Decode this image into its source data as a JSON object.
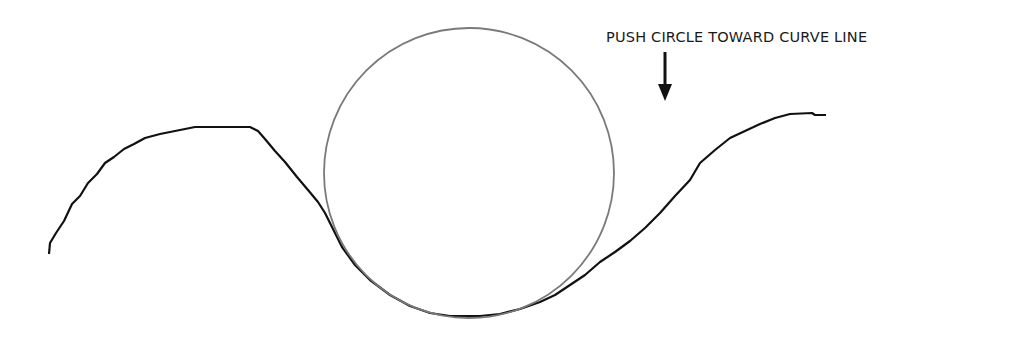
{
  "annotation": {
    "text": "PUSH CIRCLE TOWARD CURVE LINE",
    "arrow_direction": "down"
  },
  "shapes": {
    "circle": {
      "cx": 469,
      "cy": 173,
      "r": 145,
      "stroke": "#7a7a7a"
    },
    "curve": {
      "stroke": "#111111"
    }
  }
}
